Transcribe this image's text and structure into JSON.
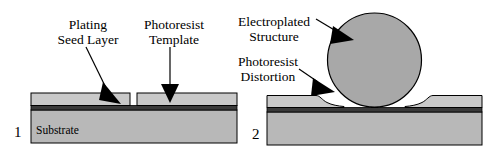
{
  "figure": {
    "title_text": "",
    "background": "#ffffff"
  },
  "colors": {
    "substrate": "#b8b8b8",
    "photoresist": "#c9c9c9",
    "seed_layer": "#3a3a3a",
    "electroplated": "#a8a8a8",
    "outline": "#000000",
    "text": "#000000"
  },
  "panels": [
    {
      "id": "panel-1",
      "number": "1",
      "substrate_label": "Substrate",
      "labels": [
        {
          "id": "plating-seed-layer",
          "line1": "Plating",
          "line2": "Seed Layer"
        },
        {
          "id": "photoresist-template",
          "line1": "Photoresist",
          "line2": "Template"
        }
      ]
    },
    {
      "id": "panel-2",
      "number": "2",
      "substrate_label": "",
      "labels": [
        {
          "id": "electroplated-structure",
          "line1": "Electroplated",
          "line2": "Structure"
        },
        {
          "id": "photoresist-distortion",
          "line1": "Photoresist",
          "line2": "Distortion"
        }
      ]
    }
  ],
  "annotations": {
    "arrow_count": "4"
  }
}
